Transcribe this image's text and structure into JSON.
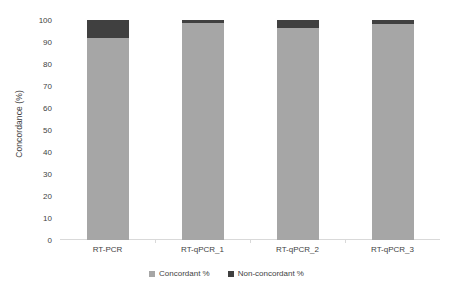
{
  "chart_data": {
    "type": "bar",
    "subtype": "stacked-column-100",
    "title": "",
    "xlabel": "",
    "ylabel": "Concordance (%)",
    "ylim": [
      0,
      100
    ],
    "yticks": [
      0,
      10,
      20,
      30,
      40,
      50,
      60,
      70,
      80,
      90,
      100
    ],
    "ytick_labels": [
      "0",
      "10",
      "20",
      "30",
      "40",
      "50",
      "60",
      "70",
      "80",
      "90",
      "100"
    ],
    "grid": false,
    "legend_position": "bottom-center",
    "categories": [
      "RT-PCR",
      "RT-qPCR_1",
      "RT-qPCR_2",
      "RT-qPCR_3"
    ],
    "series": [
      {
        "name": "Concordant %",
        "color": "#a6a6a6",
        "values": [
          92,
          98.5,
          96.5,
          98
        ]
      },
      {
        "name": "Non-concordant %",
        "color": "#404040",
        "values": [
          8,
          1.5,
          3.5,
          2
        ]
      }
    ]
  },
  "axes": {
    "y_title": "Concordance (%)"
  },
  "legend": {
    "items": [
      {
        "label": "Concordant %",
        "color": "#a6a6a6"
      },
      {
        "label": "Non-concordant %",
        "color": "#404040"
      }
    ]
  },
  "colors": {
    "concordant": "#a6a6a6",
    "non_concordant": "#404040",
    "axis_line": "#d9d9d9",
    "text": "#3f3f3f",
    "background": "#ffffff"
  }
}
